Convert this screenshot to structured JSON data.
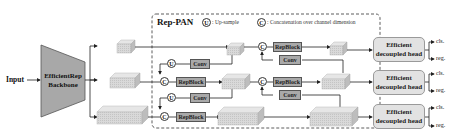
{
  "input_label": "Input",
  "backbone": {
    "line1": "EfficientRep",
    "line2": "Backbone"
  },
  "neck": {
    "title": "Rep-PAN",
    "legend": [
      {
        "symbol": "U",
        "text": ": Up-sample"
      },
      {
        "symbol": "C",
        "text": ": Concatenation over channel dimension"
      }
    ],
    "blocks": {
      "repblock": "RepBlock",
      "conv": "Conv",
      "upsample": "U",
      "concat": "C"
    }
  },
  "heads": [
    {
      "line1": "Efficient",
      "line2": "decoupled head",
      "outputs": [
        "cls.",
        "reg."
      ]
    },
    {
      "line1": "Efficient",
      "line2": "decoupled head",
      "outputs": [
        "cls.",
        "reg."
      ]
    },
    {
      "line1": "Efficient",
      "line2": "decoupled head",
      "outputs": [
        "cls.",
        "reg."
      ]
    }
  ],
  "colors": {
    "block_fill": "#a9a9a9",
    "feature_fill": "#d6d6d6",
    "head_fill": "#e2e2e2",
    "backbone_fill": "#a8a8a8"
  }
}
